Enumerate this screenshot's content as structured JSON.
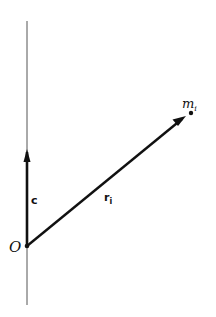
{
  "diagram": {
    "type": "vector-diagram",
    "labels": {
      "origin": "O",
      "axis_vector": "c",
      "position_vector_base": "r",
      "position_vector_sub": "i",
      "mass_base": "m",
      "mass_sub": "i"
    },
    "colors": {
      "background": "#ffffff",
      "ink": "#111111",
      "axis": "#555555"
    },
    "geometry": {
      "axis": {
        "x": 27,
        "y_top": 21,
        "y_bottom": 305
      },
      "origin": {
        "x": 27,
        "y": 246
      },
      "c_tip": {
        "x": 27,
        "y": 150
      },
      "mass_point": {
        "x": 191,
        "y": 113
      }
    }
  }
}
